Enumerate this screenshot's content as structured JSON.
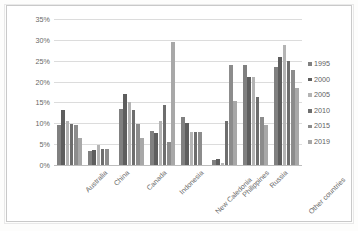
{
  "chart_data": {
    "type": "bar",
    "title": "",
    "xlabel": "",
    "ylabel": "Annual nickel production (metric tons)",
    "ylabel_lines": [
      "Annual nickel production",
      "(metric tons)"
    ],
    "ylim": [
      0,
      35
    ],
    "yticks": [
      "0%",
      "5%",
      "10%",
      "15%",
      "20%",
      "25%",
      "30%",
      "35%"
    ],
    "ytick_values": [
      0,
      5,
      10,
      15,
      20,
      25,
      30,
      35
    ],
    "grid": true,
    "legend_position": "right",
    "categories": [
      "Australia",
      "China",
      "Canada",
      "Indonesia",
      "New Caledonia",
      "Philippines",
      "Russia",
      "Other countries"
    ],
    "series": [
      {
        "name": "1995",
        "color": "#808080",
        "values": [
          9.7,
          3.4,
          13.5,
          8.2,
          11.4,
          1.2,
          24.0,
          23.4
        ]
      },
      {
        "name": "2000",
        "color": "#5e5e5e",
        "values": [
          13.3,
          3.7,
          17.0,
          7.7,
          10.1,
          1.5,
          21.2,
          25.8
        ]
      },
      {
        "name": "2005",
        "color": "#b4b4b4",
        "values": [
          10.6,
          4.8,
          15.0,
          10.6,
          8.0,
          0.6,
          21.0,
          28.7
        ]
      },
      {
        "name": "2010",
        "color": "#6e6e6e",
        "values": [
          9.9,
          3.9,
          13.1,
          14.3,
          7.9,
          10.5,
          16.4,
          24.9
        ]
      },
      {
        "name": "2015",
        "color": "#8c8c8c",
        "values": [
          9.5,
          3.8,
          9.9,
          5.4,
          8.0,
          24.0,
          11.5,
          22.8
        ]
      },
      {
        "name": "2019",
        "color": "#a8a8a8",
        "values": [
          6.5,
          0.0,
          6.5,
          29.5,
          0.0,
          15.3,
          9.7,
          18.4
        ]
      }
    ]
  },
  "legend": {
    "entries": [
      "1995",
      "2000",
      "2005",
      "2010",
      "2015",
      "2019"
    ]
  }
}
